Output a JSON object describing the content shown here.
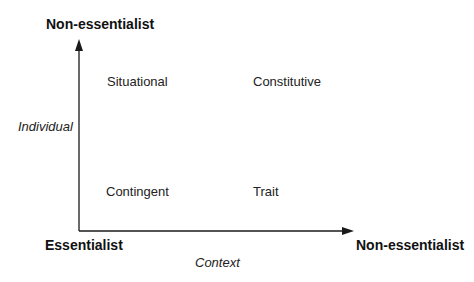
{
  "diagram": {
    "y_axis": {
      "top_label": "Non-essentialist",
      "name": "Individual"
    },
    "x_axis": {
      "right_label": "Non-essentialist",
      "name": "Context"
    },
    "origin_label": "Essentialist",
    "quadrants": {
      "top_left": "Situational",
      "top_right": "Constitutive",
      "bottom_left": "Contingent",
      "bottom_right": "Trait"
    },
    "colors": {
      "line": "#1a1a1a",
      "background": "#ffffff"
    }
  }
}
